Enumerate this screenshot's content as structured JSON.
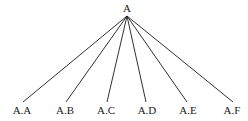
{
  "diagram": {
    "type": "tree",
    "root": {
      "label": "A",
      "x": 127,
      "y": 12,
      "apex_y": 16
    },
    "children": [
      {
        "label": "A.A",
        "x": 23,
        "line_end_y": 102
      },
      {
        "label": "A.B",
        "x": 66,
        "line_end_y": 102
      },
      {
        "label": "A.C",
        "x": 107,
        "line_end_y": 102
      },
      {
        "label": "A.D",
        "x": 146,
        "line_end_y": 102
      },
      {
        "label": "A.E",
        "x": 187,
        "line_end_y": 102
      },
      {
        "label": "A.F",
        "x": 233,
        "line_end_y": 102
      }
    ],
    "label_y": 114,
    "colors": {
      "line": "#1a1a1a",
      "text": "#1a1a1a",
      "background": "#ffffff"
    }
  }
}
